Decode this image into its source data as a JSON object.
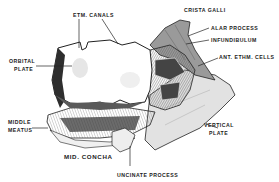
{
  "figure": {
    "labels": {
      "etm_canals": "ETM. CANALS",
      "crista_galli": "CRISTA GALLI",
      "alar_process": "ALAR PROCESS",
      "infundibulum": "INFUNDIBULUM",
      "ant_ethm_cells": "ANT. ETHM. CELLS",
      "orbital_plate_1": "ORBITAL",
      "orbital_plate_2": "PLATE",
      "middle_meatus_1": "MIDDLE",
      "middle_meatus_2": "MEATUS",
      "vertical_plate_1": "VERTICAL",
      "vertical_plate_2": "PLATE",
      "mid_concha": "MID. CONCHA",
      "uncinate_process": "UNCINATE PROCESS"
    },
    "colors": {
      "background": "#ffffff",
      "ink": "#222222",
      "dark_shade": "#3a3a3a",
      "mid_shade": "#8a8a8a",
      "light_shade": "#d6d6d6"
    }
  }
}
